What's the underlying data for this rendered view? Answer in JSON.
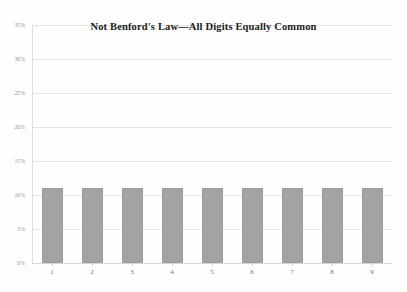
{
  "chart_data": {
    "type": "bar",
    "title": "Not Benford's Law—All Digits Equally Common",
    "xlabel": "",
    "ylabel": "",
    "categories": [
      "1",
      "2",
      "3",
      "4",
      "5",
      "6",
      "7",
      "8",
      "9"
    ],
    "values": [
      11.1,
      11.1,
      11.1,
      11.1,
      11.1,
      11.1,
      11.1,
      11.1,
      11.1
    ],
    "ylim": [
      0,
      35
    ],
    "ytick_values": [
      0,
      5,
      10,
      15,
      20,
      25,
      30,
      35
    ],
    "ytick_labels": [
      "0%",
      "5%",
      "10%",
      "15%",
      "20%",
      "25%",
      "30%",
      "35%"
    ],
    "grid": true,
    "legend": false,
    "series": [
      {
        "name": "Digit frequency",
        "values": [
          11.1,
          11.1,
          11.1,
          11.1,
          11.1,
          11.1,
          11.1,
          11.1,
          11.1
        ]
      }
    ],
    "colors": {
      "bar_fill": "#a3a3a3",
      "bar_border": "#9b9b9b",
      "gridline": "#e3e3e6",
      "axis": "#d8d8db",
      "title_text": "#1a1a1a",
      "tick_text": "#6f6f75",
      "background": "#fefefe"
    }
  }
}
